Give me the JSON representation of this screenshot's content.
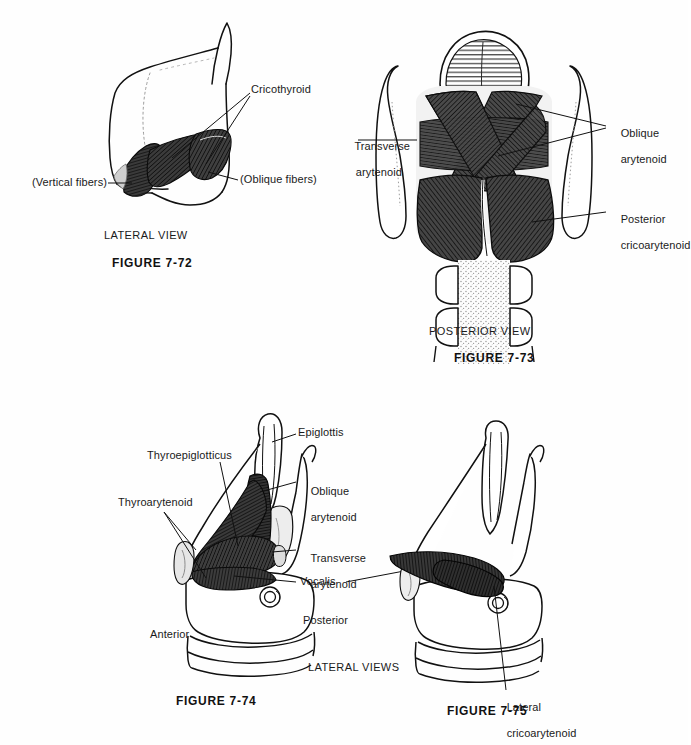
{
  "page": {
    "background": "#fefefe",
    "ink": "#111111",
    "muscle_fill": "#3a3a3a"
  },
  "figures": [
    {
      "id": "fig-7-72",
      "caption": "FIGURE 7-72",
      "view_label": "LATERAL VIEW",
      "labels": [
        {
          "name": "cricothyroid",
          "text": "Cricothyroid"
        },
        {
          "name": "vertical-fibers",
          "text": "(Vertical fibers)"
        },
        {
          "name": "oblique-fibers",
          "text": "(Oblique fibers)"
        }
      ]
    },
    {
      "id": "fig-7-73",
      "caption": "FIGURE 7-73",
      "view_label": "POSTERIOR VIEW",
      "labels": [
        {
          "name": "transverse-arytenoid",
          "line1": "Transverse",
          "line2": "arytenoid"
        },
        {
          "name": "oblique-arytenoid",
          "line1": "Oblique",
          "line2": "arytenoid"
        },
        {
          "name": "posterior-cricoarytenoid",
          "line1": "Posterior",
          "line2": "cricoarytenoid"
        }
      ]
    },
    {
      "id": "fig-7-74",
      "caption": "FIGURE 7-74",
      "view_label": "LATERAL VIEWS",
      "labels": [
        {
          "name": "epiglottis",
          "text": "Epiglottis"
        },
        {
          "name": "thyroepiglotticus",
          "text": "Thyroepiglotticus"
        },
        {
          "name": "thyroarytenoid",
          "text": "Thyroarytenoid"
        },
        {
          "name": "oblique-arytenoid",
          "line1": "Oblique",
          "line2": "arytenoid"
        },
        {
          "name": "transverse-arytenoid",
          "line1": "Transverse",
          "line2": "arytenoid"
        },
        {
          "name": "vocalis",
          "text": "Vocalis"
        },
        {
          "name": "anterior",
          "text": "Anterior"
        },
        {
          "name": "posterior",
          "text": "Posterior"
        }
      ]
    },
    {
      "id": "fig-7-75",
      "caption": "FIGURE 7-75",
      "labels": [
        {
          "name": "lateral-cricoarytenoid",
          "line1": "Lateral",
          "line2": "cricoarytenoid"
        }
      ]
    }
  ]
}
